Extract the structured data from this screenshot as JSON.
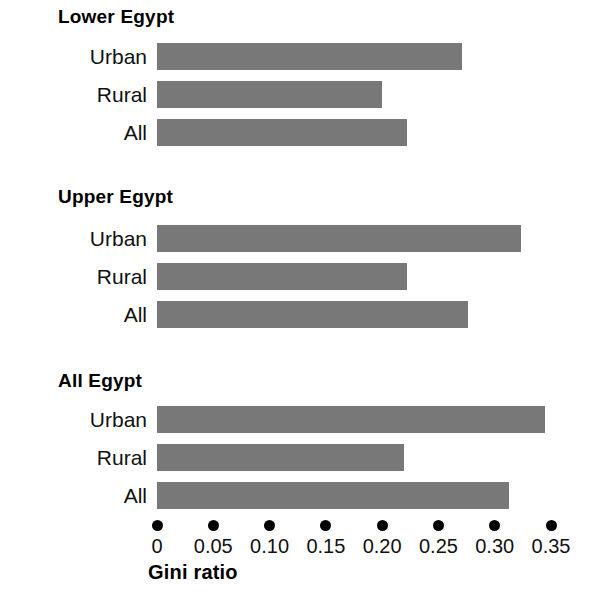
{
  "chart_data": {
    "type": "bar",
    "orientation": "horizontal",
    "title": "",
    "xlabel": "Gini ratio",
    "ylabel": "",
    "xlim": [
      0,
      0.35
    ],
    "grid": false,
    "legend": false,
    "bar_color": "#787878",
    "tick_style": "dots",
    "xticks": [
      0,
      0.05,
      0.1,
      0.15,
      0.2,
      0.25,
      0.3,
      0.35
    ],
    "xtick_labels": [
      "0",
      "0.05",
      "0.10",
      "0.15",
      "0.20",
      "0.25",
      "0.30",
      "0.35"
    ],
    "groups": [
      {
        "name": "Lower Egypt",
        "categories": [
          "Urban",
          "Rural",
          "All"
        ],
        "values": [
          0.271,
          0.2,
          0.222
        ]
      },
      {
        "name": "Upper Egypt",
        "categories": [
          "Urban",
          "Rural",
          "All"
        ],
        "values": [
          0.323,
          0.222,
          0.276
        ]
      },
      {
        "name": "All Egypt",
        "categories": [
          "Urban",
          "Rural",
          "All"
        ],
        "values": [
          0.345,
          0.219,
          0.313
        ]
      }
    ]
  },
  "axis": {
    "title": "Gini ratio"
  }
}
